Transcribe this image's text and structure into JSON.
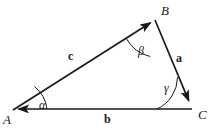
{
  "figure": {
    "type": "geometry-diagram",
    "background_color": "#ffffff",
    "stroke_color": "#1a1a1a",
    "text_color": "#1a1a1a"
  },
  "vertices": [
    {
      "name": "vertex-a",
      "label": "A",
      "x": 13,
      "y": 110,
      "label_x": 3,
      "label_y": 113
    },
    {
      "name": "vertex-b",
      "label": "B",
      "x": 155,
      "y": 20,
      "label_x": 161,
      "label_y": 4
    },
    {
      "name": "vertex-c",
      "label": "C",
      "x": 192,
      "y": 108,
      "label_x": 198,
      "label_y": 108
    }
  ],
  "sides": [
    {
      "name": "side-c",
      "label": "c",
      "from": "A",
      "to": "B",
      "arrow_at": "B",
      "label_x": 68,
      "label_y": 50
    },
    {
      "name": "side-a",
      "label": "a",
      "from": "B",
      "to": "C",
      "arrow_at": "C",
      "label_x": 176,
      "label_y": 52
    },
    {
      "name": "side-b",
      "label": "b",
      "from": "C",
      "to": "A",
      "arrow_at": "A",
      "label_x": 104,
      "label_y": 113
    }
  ],
  "angles": [
    {
      "name": "angle-alpha",
      "label": "α",
      "at_vertex": "A",
      "label_x": 39,
      "label_y": 99
    },
    {
      "name": "angle-beta",
      "label": "β",
      "at_vertex": "B",
      "label_x": 138,
      "label_y": 45
    },
    {
      "name": "angle-gamma",
      "label": "γ",
      "at_vertex": "C",
      "label_x": 164,
      "label_y": 82
    }
  ]
}
